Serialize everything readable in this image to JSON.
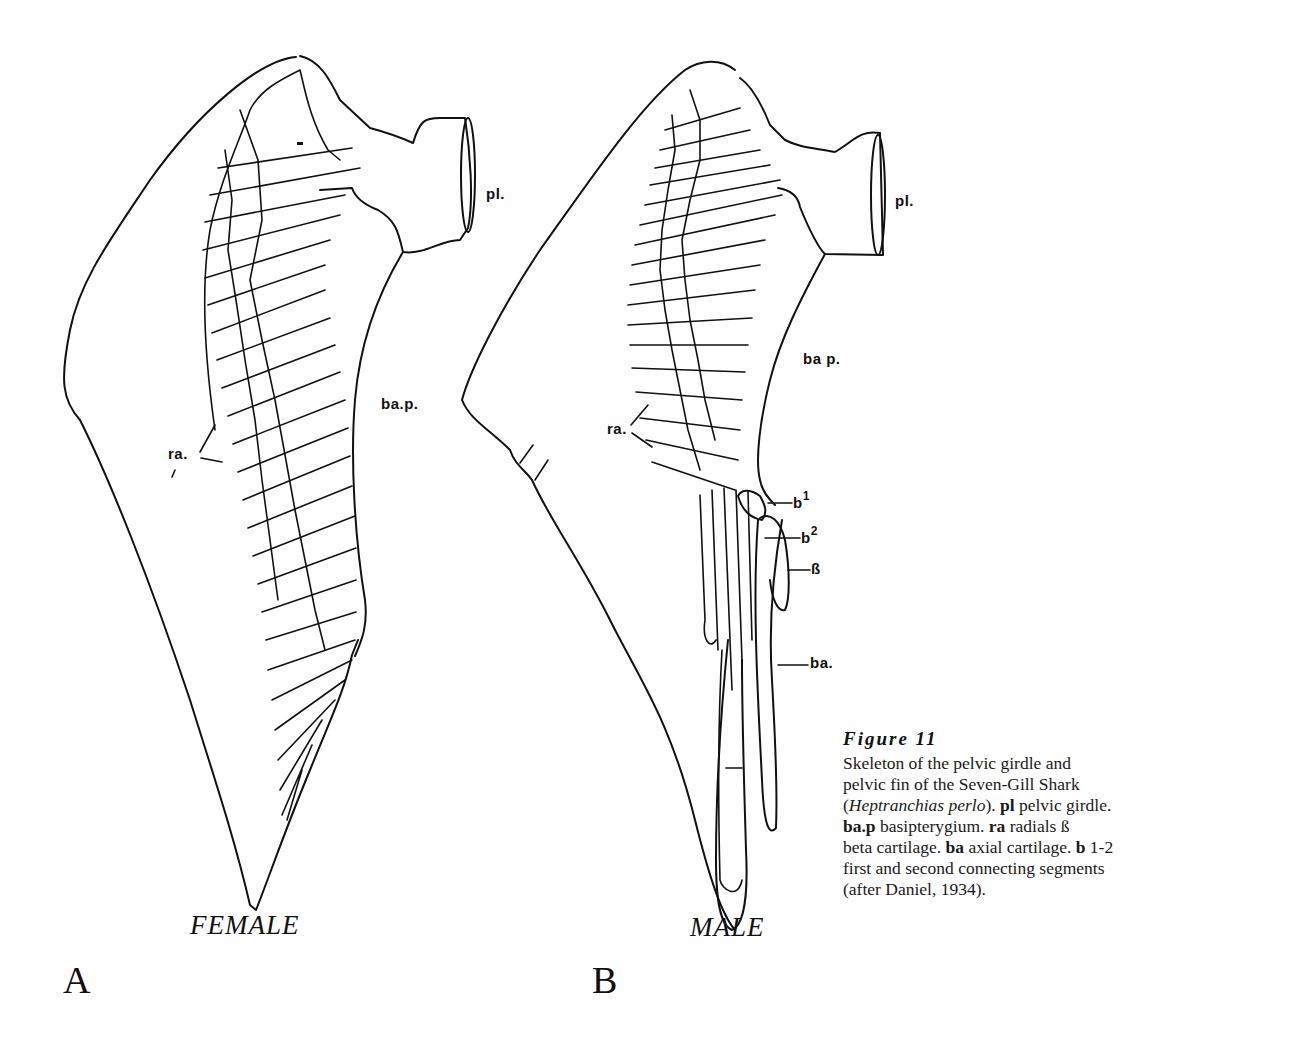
{
  "figure": {
    "title": "Figure 11",
    "caption_lines": [
      "Skeleton of the pelvic girdle and",
      "pelvic fin of the Seven-Gill Shark",
      "(Heptranchias perlo). pl pelvic girdle.",
      "ba.p basipterygium. ra radials ß",
      "beta cartilage. ba axial cartilage. b 1-2",
      "first and second connecting segments",
      "(after Daniel, 1934)."
    ],
    "caption_parts": {
      "line1": "Skeleton of the pelvic girdle and",
      "line2": "pelvic fin of the Seven-Gill Shark",
      "line3_open": "(",
      "species": "Heptranchias perlo",
      "line3_close": "). ",
      "pl_term": "pl",
      "pl_def": " pelvic girdle.",
      "bap_term": "ba.p",
      "bap_def": " basipterygium. ",
      "ra_term": "ra",
      "ra_def": " radials ß",
      "beta_def": "beta cartilage. ",
      "ba_term": "ba",
      "ba_def": " axial cartilage. ",
      "b_term": "b",
      "b_def": " 1-2",
      "line6": "first and second connecting segments",
      "line7": "(after Daniel, 1934)."
    }
  },
  "panels": [
    {
      "letter": "A",
      "sex": "FEMALE",
      "labels": {
        "pl": "pl.",
        "bap": "ba.p.",
        "ra": "ra."
      }
    },
    {
      "letter": "B",
      "sex": "MALE",
      "labels": {
        "pl": "pl.",
        "bap": "ba p.",
        "ra": "ra.",
        "b1_base": "b",
        "b1_sup": "1",
        "b2_base": "b",
        "b2_sup": "2",
        "beta": "ß",
        "ba": "ba."
      }
    }
  ],
  "colors": {
    "ink": "#111111",
    "paper": "#ffffff"
  }
}
